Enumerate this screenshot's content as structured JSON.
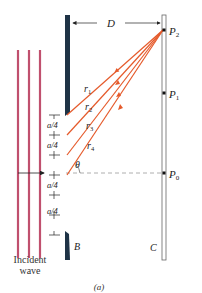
{
  "figure": {
    "caption": "(a)",
    "colors": {
      "wave": "#c0506e",
      "barrier": "#1f3346",
      "ray": "#e55a2b",
      "screen": "#555555",
      "dashed": "#999999",
      "text": "#222222"
    }
  },
  "labels": {
    "distance": "D",
    "barrier": "B",
    "screen": "C",
    "angle": "θ",
    "incident_line1": "Incident",
    "incident_line2": "wave",
    "p2": "P",
    "p2_sub": "2",
    "p1": "P",
    "p1_sub": "1",
    "p0": "P",
    "p0_sub": "0",
    "rays": [
      {
        "name": "r",
        "sub": "1"
      },
      {
        "name": "r",
        "sub": "2"
      },
      {
        "name": "r",
        "sub": "3"
      },
      {
        "name": "r",
        "sub": "4"
      }
    ],
    "spacing": [
      "a/4",
      "a/4",
      "a/4",
      "a/4"
    ]
  }
}
